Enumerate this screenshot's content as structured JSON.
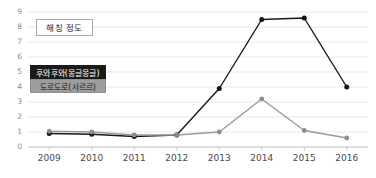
{
  "chart_data": {
    "type": "line",
    "title": "해칭 정도",
    "xlabel": "",
    "ylabel": "",
    "x": [
      "2009",
      "2010",
      "2011",
      "2012",
      "2013",
      "2014",
      "2015",
      "2016"
    ],
    "categories": [
      "2009",
      "2010",
      "2011",
      "2012",
      "2013",
      "2014",
      "2015",
      "2016"
    ],
    "ylim": [
      0,
      9
    ],
    "yticks": [
      "0",
      "1",
      "2",
      "3",
      "4",
      "5",
      "6",
      "7",
      "8",
      "9"
    ],
    "grid": true,
    "legend_position": "upper-left-inside",
    "series": [
      {
        "name": "후와후와(몽글몽글)",
        "color": "#1a1a1a",
        "values": [
          0.9,
          0.85,
          0.7,
          0.8,
          3.9,
          8.5,
          8.6,
          4.0
        ]
      },
      {
        "name": "도로도로(사르르)",
        "color": "#9a9a9a",
        "values": [
          1.05,
          1.0,
          0.8,
          0.8,
          1.0,
          3.2,
          1.1,
          0.6
        ]
      }
    ]
  },
  "legend": {
    "items": [
      {
        "label": "후와후와(몽글몽글)",
        "style": "dark"
      },
      {
        "label": "도로도로(사르르)",
        "style": "gray"
      }
    ]
  }
}
